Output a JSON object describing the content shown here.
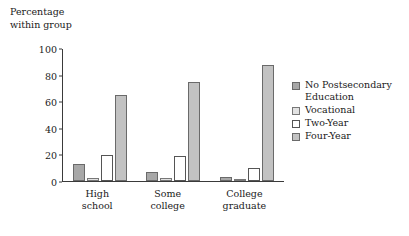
{
  "chart_data": {
    "type": "bar",
    "title": "",
    "ylabel": "Percentage\nwithin group",
    "xlabel": "",
    "ylim": [
      0,
      100
    ],
    "yticks": [
      0,
      20,
      40,
      60,
      80,
      100
    ],
    "grid": false,
    "legend_position": "right",
    "categories": [
      "High\nschool",
      "Some\ncollege",
      "College\ngraduate"
    ],
    "series": [
      {
        "name": "No Postsecondary\nEducation",
        "color": "#a8a8a8",
        "values": [
          13,
          7,
          3
        ]
      },
      {
        "name": "Vocational",
        "color": "#e2e2e2",
        "values": [
          2,
          2,
          1
        ]
      },
      {
        "name": "Two-Year",
        "color": "#ffffff",
        "values": [
          20,
          19,
          10
        ]
      },
      {
        "name": "Four-Year",
        "color": "#c2c2c2",
        "values": [
          65,
          75,
          88
        ]
      }
    ]
  }
}
